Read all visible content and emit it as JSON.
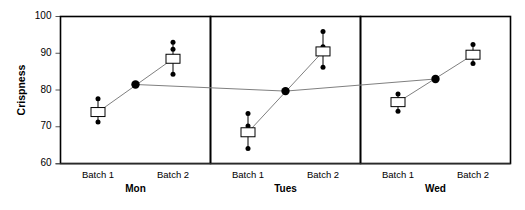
{
  "chart_data": {
    "type": "scatter",
    "title": "",
    "xlabel": "",
    "ylabel": "Crispness",
    "ylim": [
      60,
      100
    ],
    "yticks": [
      60,
      70,
      80,
      90,
      100
    ],
    "ytick_labels": [
      "60",
      "70",
      "80",
      "90",
      "100"
    ],
    "grid": false,
    "legend": false,
    "panel_labels": [
      "Mon",
      "Tues",
      "Wed"
    ],
    "category_labels": [
      "Batch 1",
      "Batch 2"
    ],
    "colors": {
      "point": "#000000",
      "frame": "#000000",
      "connector": "#808080",
      "mean_marker_fill": "#ffffff",
      "mean_marker_stroke": "#000000"
    },
    "panels": [
      {
        "name": "Mon",
        "group_mean": 81.5,
        "groups": [
          {
            "label": "Batch 1",
            "mean": 74.0,
            "points": [
              77.6,
              74.2,
              71.3
            ]
          },
          {
            "label": "Batch 2",
            "mean": 88.5,
            "points": [
              93.0,
              91.1,
              84.3
            ]
          }
        ]
      },
      {
        "name": "Tues",
        "group_mean": 79.7,
        "groups": [
          {
            "label": "Batch 1",
            "mean": 68.5,
            "points": [
              73.6,
              70.2,
              64.1
            ]
          },
          {
            "label": "Batch 2",
            "mean": 90.5,
            "points": [
              95.9,
              91.8,
              86.2
            ]
          }
        ]
      },
      {
        "name": "Wed",
        "group_mean": 83.0,
        "groups": [
          {
            "label": "Batch 1",
            "mean": 76.7,
            "points": [
              78.9,
              77.0,
              74.2
            ]
          },
          {
            "label": "Batch 2",
            "mean": 89.6,
            "points": [
              92.4,
              89.3,
              87.2
            ]
          }
        ]
      }
    ]
  }
}
